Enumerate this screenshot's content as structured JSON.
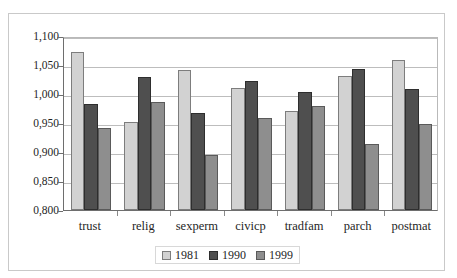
{
  "caption": {
    "fragment": "and 1999."
  },
  "chart_data": {
    "type": "bar",
    "title": "",
    "subtitle": "",
    "xlabel": "",
    "ylabel": "",
    "categories": [
      "trust",
      "relig",
      "sexperm",
      "civicp",
      "tradfam",
      "parch",
      "postmat"
    ],
    "series": [
      {
        "name": "1981",
        "color": "#d2d2d2",
        "values": [
          1.072,
          0.952,
          1.042,
          1.011,
          0.971,
          1.031,
          1.059
        ]
      },
      {
        "name": "1990",
        "color": "#4f4f4f",
        "values": [
          0.983,
          1.03,
          0.967,
          1.022,
          1.004,
          1.043,
          1.008
        ]
      },
      {
        "name": "1999",
        "color": "#8e8e8e",
        "values": [
          0.941,
          0.986,
          0.895,
          0.959,
          0.979,
          0.914,
          0.949
        ]
      }
    ],
    "ylim": [
      0.8,
      1.1
    ],
    "ytick_values": [
      1.1,
      1.05,
      1.0,
      0.95,
      0.9,
      0.85,
      0.8
    ],
    "ytick_labels": [
      "1,100",
      "1,050",
      "1,000",
      "0,950",
      "0,900",
      "0,850",
      "0,800"
    ],
    "grid": true,
    "legend_position": "bottom",
    "legend_entries": [
      "1981",
      "1990",
      "1999"
    ]
  }
}
